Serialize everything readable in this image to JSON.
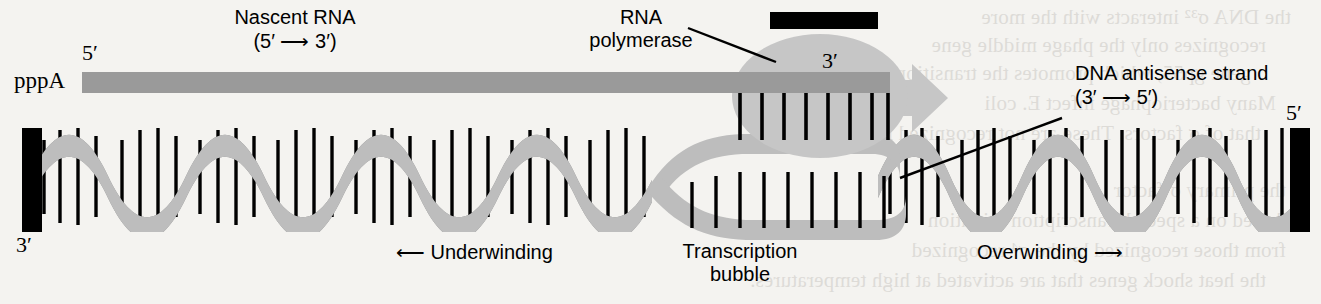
{
  "figure": {
    "name": "transcription-bubble-diagram",
    "background": "#f4f3f0"
  },
  "colors": {
    "rna_strand": "#9a9a9a",
    "dna_light_ribbon": "#bdbdbd",
    "dna_dark_ribbon": "#8d8d8d",
    "polymerase_body": "#c6c6c6",
    "polymerase_bar": "#000000",
    "base_pair_line": "#000000",
    "end_bar": "#000000",
    "text": "#000000"
  },
  "labels": {
    "nascent_rna_title": "Nascent RNA",
    "nascent_rna_direction": "(5′ ⟶ 3′)",
    "rna_polymerase_line1": "RNA",
    "rna_polymerase_line2": "polymerase",
    "dna_antisense_title": "DNA antisense strand",
    "dna_antisense_direction": "(3′ ⟶ 5′)",
    "transcription_bubble_line1": "Transcription",
    "transcription_bubble_line2": "bubble",
    "underwinding": "⟵  Underwinding",
    "overwinding": "Overwinding  ⟶",
    "rna_5_prime": "5′",
    "rna_cap": "pppA",
    "rna_3_prime": "3′",
    "dna_left_3_prime": "3′",
    "dna_right_5_prime": "5′"
  },
  "bleed_through_text": [
    "the DNA σ³² interacts with the more",
    "recognizes only the phage middle gene",
    "gene gp55, which promotes the transition only",
    "Many bacteriophage infect E. coli",
    "that of σ factors. These are not recognized in",
    "the primary σ factor",
    "based on a special transcription initiation",
    "from those recognized by the σ⁴ recognized",
    "the heat shock genes that are activated at high temperatures."
  ],
  "structure": {
    "helix_left": {
      "label": "underwound-helix",
      "x_start": 30,
      "x_end": 650,
      "period_px": 105,
      "turns": 6
    },
    "helix_right": {
      "label": "overwound-helix",
      "x_start": 880,
      "x_end": 1300,
      "period_px": 95,
      "turns": 4.5
    },
    "bubble": {
      "x_start": 650,
      "x_end": 905,
      "hybrid_base_pairs": 8,
      "open_base_pairs": 9
    },
    "rna": {
      "x_start": 82,
      "x_end": 890,
      "y": 72,
      "height": 20
    },
    "polymerase": {
      "cx": 820,
      "cy": 96,
      "rx": 88,
      "ry": 62
    }
  }
}
